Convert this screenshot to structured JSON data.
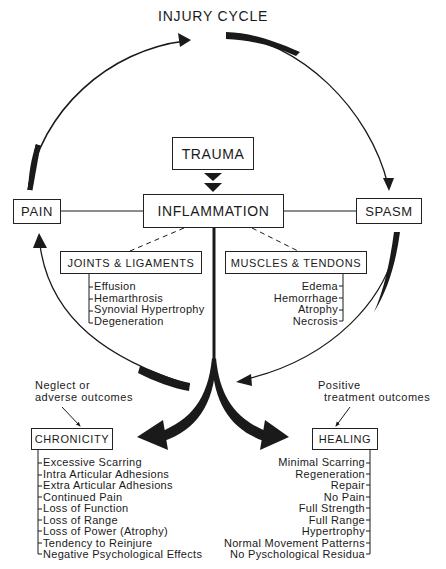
{
  "diagram": {
    "title": "INJURY CYCLE",
    "nodes": {
      "trauma": "TRAUMA",
      "inflammation": "INFLAMMATION",
      "pain": "PAIN",
      "spasm": "SPASM",
      "joints": "JOINTS & LIGAMENTS",
      "muscles": "MUSCLES & TENDONS",
      "chronicity": "CHRONICITY",
      "healing": "HEALING"
    },
    "joints_items": [
      "Effusion",
      "Hemarthrosis",
      "Synovial Hypertrophy",
      "Degeneration"
    ],
    "muscles_items": [
      "Edema",
      "Hemorrhage",
      "Atrophy",
      "Necrosis"
    ],
    "chronicity_items": [
      "Excessive Scarring",
      "Intra Articular Adhesions",
      "Extra Articular Adhesions",
      "Continued Pain",
      "Loss of Function",
      "Loss of Range",
      "Loss of Power (Atrophy)",
      "Tendency to Reinjure",
      "Negative Psychological Effects"
    ],
    "healing_items": [
      "Minimal Scarring",
      "Regeneration",
      "Repair",
      "No Pain",
      "Full Strength",
      "Full Range",
      "Hypertrophy",
      "Normal Movement Patterns",
      "No Pyschological Residua"
    ],
    "notes": {
      "neglect_line1": "Neglect or",
      "neglect_line2": "adverse outcomes",
      "positive_line1": "Positive",
      "positive_line2": "treatment outcomes"
    },
    "edges": [
      {
        "from": "pain",
        "to": "top",
        "style": "tapered-arrow"
      },
      {
        "from": "top",
        "to": "spasm",
        "style": "tapered-arrow"
      },
      {
        "from": "trauma",
        "to": "inflammation",
        "style": "double-chevron"
      },
      {
        "from": "inflammation",
        "to": "pain",
        "style": "line"
      },
      {
        "from": "inflammation",
        "to": "spasm",
        "style": "line"
      },
      {
        "from": "inflammation",
        "to": "joints",
        "style": "dashed"
      },
      {
        "from": "inflammation",
        "to": "muscles",
        "style": "dashed"
      },
      {
        "from": "inflammation",
        "to": "chronicity",
        "style": "thick-curved-arrow"
      },
      {
        "from": "inflammation",
        "to": "healing",
        "style": "thick-curved-arrow"
      },
      {
        "from": "center",
        "to": "pain",
        "style": "curved-arrow"
      },
      {
        "from": "spasm",
        "to": "center",
        "style": "curved-arrow"
      },
      {
        "from": "neglect-note",
        "to": "chronicity",
        "style": "thin-arrow"
      },
      {
        "from": "positive-note",
        "to": "healing",
        "style": "thin-arrow"
      }
    ],
    "colors": {
      "ink": "#1a1a1a",
      "background": "#ffffff"
    }
  }
}
